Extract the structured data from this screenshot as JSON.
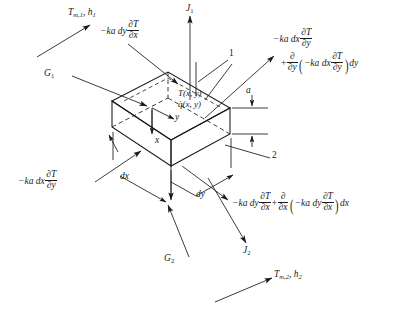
{
  "figure": {
    "type": "engineering-diagram"
  },
  "geometry": {
    "description": "Rectangular differential slab element (dx by dy by thickness a) drawn in oblique/isometric projection",
    "box": {
      "thickness_label": "a",
      "depth_label": "dx",
      "width_label": "dy"
    },
    "surfaces": {
      "top_surface_number": "1",
      "bottom_surface_number": "2"
    }
  },
  "labels": {
    "fluid_top": {
      "symbol": "T",
      "sub": "m,1",
      "symbol2": "h",
      "sub2": "1"
    },
    "fluid_bottom": {
      "symbol": "T",
      "sub": "m,2",
      "symbol2": "h",
      "sub2": "2"
    },
    "irradiation_top": {
      "symbol": "G",
      "sub": "1"
    },
    "irradiation_bottom": {
      "symbol": "G",
      "sub": "2"
    },
    "radiosity_top": {
      "symbol": "J",
      "sub": "1"
    },
    "radiosity_bottom": {
      "symbol": "J",
      "sub": "2"
    },
    "temperature_field": "T(x, y)",
    "heat_generation": "q̇(x, y)",
    "axis_x": "x",
    "axis_y": "y",
    "surface_1": "1",
    "surface_2": "2",
    "thickness": "a",
    "dx": "dx",
    "dy": "dy"
  },
  "equations": {
    "flux_in_x": {
      "parts": [
        "−ka dy",
        "∂T",
        "∂x"
      ],
      "plain": "-ka dy dT/dx"
    },
    "flux_in_y": {
      "parts": [
        "−ka dx",
        "∂T",
        "∂y"
      ],
      "plain": "-ka dx dT/dy"
    },
    "flux_out_y": {
      "term1_coeff": "−ka dx",
      "term1_num": "∂T",
      "term1_den": "∂y",
      "plus": "+",
      "op_num": "∂",
      "op_den": "∂y",
      "inner_coeff": "−ka dx",
      "inner_num": "∂T",
      "inner_den": "∂y",
      "differential": "dy",
      "plain": "-ka dx dT/dy + d/dy(-ka dx dT/dy) dy"
    },
    "flux_out_x": {
      "term1_coeff": "−ka dy",
      "term1_num": "∂T",
      "term1_den": "∂x",
      "plus": "+",
      "op_num": "∂",
      "op_den": "∂x",
      "inner_coeff": "−ka dy",
      "inner_num": "∂T",
      "inner_den": "∂x",
      "differential": "dx",
      "plain": "-ka dy dT/dx + d/dx(-ka dy dT/dx) dx"
    }
  },
  "colors": {
    "line": "#1a1a1a",
    "text": "#1a1a1a",
    "background": "#ffffff"
  }
}
